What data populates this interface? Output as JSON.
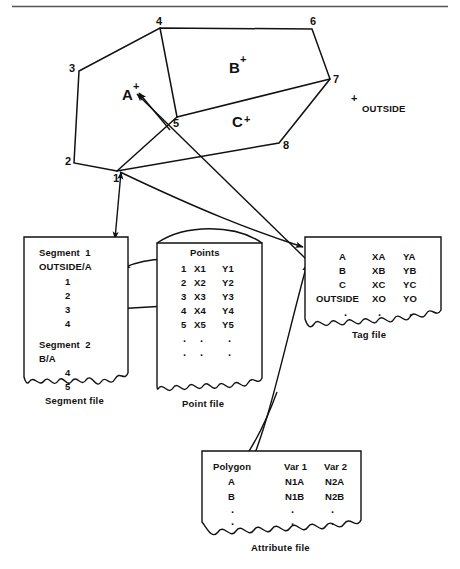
{
  "figure": {
    "type": "diagram",
    "top_rule": true
  },
  "map": {
    "vertex_labels": [
      "1",
      "2",
      "3",
      "4",
      "5",
      "6",
      "7",
      "8"
    ],
    "polygons": [
      {
        "label": "A",
        "marker": "+"
      },
      {
        "label": "B",
        "marker": "+"
      },
      {
        "label": "C",
        "marker": "+"
      }
    ],
    "outside": {
      "marker": "+",
      "label": "OUTSIDE"
    }
  },
  "segment_file": {
    "caption": "Segment file",
    "blocks": [
      {
        "title": "Segment  1",
        "relation": "OUTSIDE/A",
        "points": [
          "1",
          "2",
          "3",
          "4"
        ]
      },
      {
        "title": "Segment  2",
        "relation": "B/A",
        "points": [
          "4",
          "5"
        ]
      }
    ]
  },
  "point_file": {
    "caption": "Point file",
    "header": "Points",
    "rows": [
      {
        "id": "1",
        "x": "X1",
        "y": "Y1"
      },
      {
        "id": "2",
        "x": "X2",
        "y": "Y2"
      },
      {
        "id": "3",
        "x": "X3",
        "y": "Y3"
      },
      {
        "id": "4",
        "x": "X4",
        "y": "Y4"
      },
      {
        "id": "5",
        "x": "X5",
        "y": "Y5"
      }
    ],
    "continuation_rows": [
      {
        "id": ".",
        "x": ".",
        "y": "."
      },
      {
        "id": ".",
        "x": ".",
        "y": "."
      }
    ]
  },
  "tag_file": {
    "caption": "Tag file",
    "rows": [
      {
        "name": "A",
        "x": "XA",
        "y": "YA"
      },
      {
        "name": "B",
        "x": "XB",
        "y": "YB"
      },
      {
        "name": "C",
        "x": "XC",
        "y": "YC"
      },
      {
        "name": "OUTSIDE",
        "x": "XO",
        "y": "YO"
      }
    ],
    "continuation_rows": [
      {
        "name": "",
        "x": ".",
        "y": ".",
        "c": "."
      }
    ]
  },
  "attribute_file": {
    "caption": "Attribute file",
    "headers": [
      "Polygon",
      "Var 1",
      "Var 2"
    ],
    "rows": [
      {
        "polygon": "A",
        "var1": "N1A",
        "var2": "N2A"
      },
      {
        "polygon": "B",
        "var1": "N1B",
        "var2": "N2B"
      }
    ],
    "continuation_rows": [
      {
        "polygon": ".",
        "var1": ".",
        "var2": "."
      },
      {
        "polygon": ".",
        "var1": ".",
        "var2": "."
      }
    ]
  },
  "colors": {
    "ink": "#111111",
    "paper": "#ffffff",
    "rule": "#555555"
  }
}
